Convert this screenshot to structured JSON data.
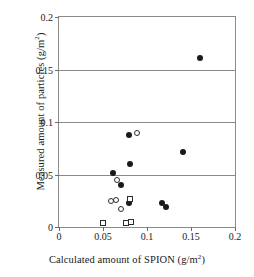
{
  "chart_data": {
    "type": "scatter",
    "title": "",
    "xlabel": "Calculated amount of SPION (g/m2)",
    "ylabel": "Measured amount of particles (g/m2)",
    "xlim": [
      0,
      0.2
    ],
    "ylim": [
      0,
      0.2
    ],
    "xticks": [
      "0",
      "0.05",
      "0.1",
      "0.15",
      "0.2"
    ],
    "xtick_values": [
      0,
      0.05,
      0.1,
      0.15,
      0.2
    ],
    "yticks": [
      "0",
      "0.05",
      "0.1",
      "0.15",
      "0.2"
    ],
    "ytick_values": [
      0,
      0.05,
      0.1,
      0.15,
      0.2
    ],
    "grid": "horizontal",
    "legend": "none",
    "series": [
      {
        "name": "filled-circle",
        "marker": "m-filled-circle",
        "points": [
          [
            0.16,
            0.161
          ],
          [
            0.141,
            0.071
          ],
          [
            0.08,
            0.088
          ],
          [
            0.081,
            0.06
          ],
          [
            0.061,
            0.051
          ],
          [
            0.071,
            0.04
          ],
          [
            0.08,
            0.023
          ],
          [
            0.117,
            0.023
          ],
          [
            0.122,
            0.019
          ]
        ]
      },
      {
        "name": "open-circle",
        "marker": "m-open-circle",
        "points": [
          [
            0.089,
            0.09
          ],
          [
            0.066,
            0.045
          ],
          [
            0.059,
            0.025
          ],
          [
            0.065,
            0.026
          ],
          [
            0.07,
            0.017
          ]
        ]
      },
      {
        "name": "open-square",
        "marker": "m-open-square",
        "points": [
          [
            0.081,
            0.027
          ],
          [
            0.05,
            0.004
          ],
          [
            0.076,
            0.004
          ],
          [
            0.082,
            0.005
          ]
        ]
      }
    ]
  },
  "axes": {
    "xlabel_main": "Calculated amount of SPION (g/m",
    "xlabel_sup": "2",
    "xlabel_tail": ")",
    "ylabel_main": "Measured amount of particles (g/m",
    "ylabel_sup": "2",
    "ylabel_tail": ")"
  }
}
